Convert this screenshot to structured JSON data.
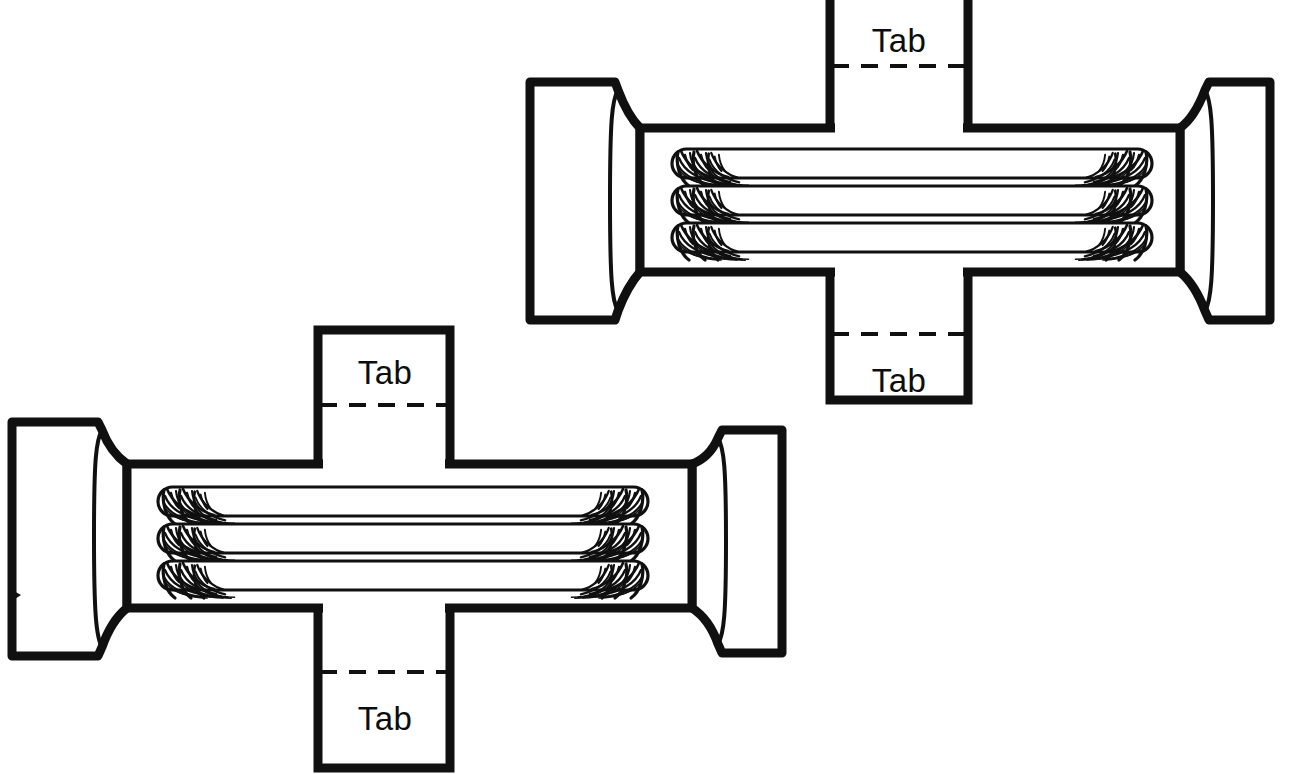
{
  "document": {
    "title": "Tube Bundle Cutout Pattern",
    "type": "line-art-diagram",
    "background_color": "#ffffff",
    "ink_color": "#101010",
    "canvas": {
      "width": 1303,
      "height": 774
    }
  },
  "labels": {
    "tab": "Tab"
  },
  "figures": [
    {
      "id": "upper-pattern",
      "name": "upper cutout pattern",
      "tab_count": 4,
      "tube_count": 3,
      "tabs": [
        {
          "position": "top",
          "label": "Tab",
          "fold_line": "dashed"
        },
        {
          "position": "bottom",
          "label": "Tab",
          "fold_line": "dashed"
        }
      ]
    },
    {
      "id": "lower-pattern",
      "name": "lower cutout pattern",
      "tab_count": 4,
      "tube_count": 3,
      "tabs": [
        {
          "position": "top",
          "label": "Tab",
          "fold_line": "dashed"
        },
        {
          "position": "bottom",
          "label": "Tab",
          "fold_line": "dashed"
        }
      ]
    }
  ],
  "legend": {
    "dashed_line_meaning": "fold line",
    "solid_line_meaning": "cut line"
  }
}
